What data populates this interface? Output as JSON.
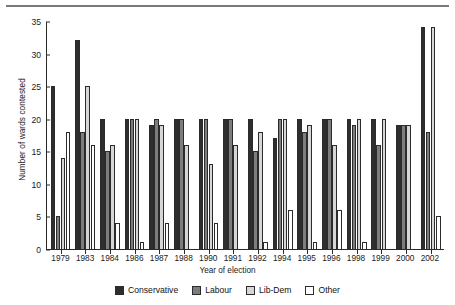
{
  "chart_data": {
    "type": "bar",
    "title": "",
    "xlabel": "Year of election",
    "ylabel": "Number of wards contested",
    "ylim": [
      0,
      35
    ],
    "yticks": [
      0,
      5,
      10,
      15,
      20,
      25,
      30,
      35
    ],
    "grid": false,
    "legend_position": "bottom",
    "categories": [
      "1979",
      "1983",
      "1984",
      "1986",
      "1987",
      "1988",
      "1990",
      "1991",
      "1992",
      "1994",
      "1995",
      "1996",
      "1998",
      "1999",
      "2000",
      "2002"
    ],
    "series": [
      {
        "name": "Conservative",
        "color": "#2e2e2e",
        "values": [
          25,
          32,
          20,
          20,
          19,
          20,
          20,
          20,
          20,
          17,
          20,
          20,
          20,
          20,
          19,
          34
        ]
      },
      {
        "name": "Labour",
        "color": "#7d7d7d",
        "values": [
          5,
          18,
          15,
          20,
          20,
          20,
          20,
          20,
          15,
          20,
          18,
          20,
          19,
          16,
          19,
          18
        ]
      },
      {
        "name": "Lib-Dem",
        "color": "#d6d6d6",
        "values": [
          14,
          25,
          16,
          20,
          19,
          16,
          13,
          16,
          18,
          20,
          19,
          16,
          20,
          20,
          19,
          34
        ]
      },
      {
        "name": "Other",
        "color": "#ffffff",
        "values": [
          18,
          16,
          4,
          1,
          4,
          0,
          4,
          0,
          1,
          6,
          1,
          6,
          1,
          0,
          0,
          5
        ]
      }
    ]
  },
  "legend": {
    "items": [
      {
        "label": "Conservative",
        "key": "conservative"
      },
      {
        "label": "Labour",
        "key": "labour"
      },
      {
        "label": "Lib-Dem",
        "key": "libdem"
      },
      {
        "label": "Other",
        "key": "other"
      }
    ]
  }
}
